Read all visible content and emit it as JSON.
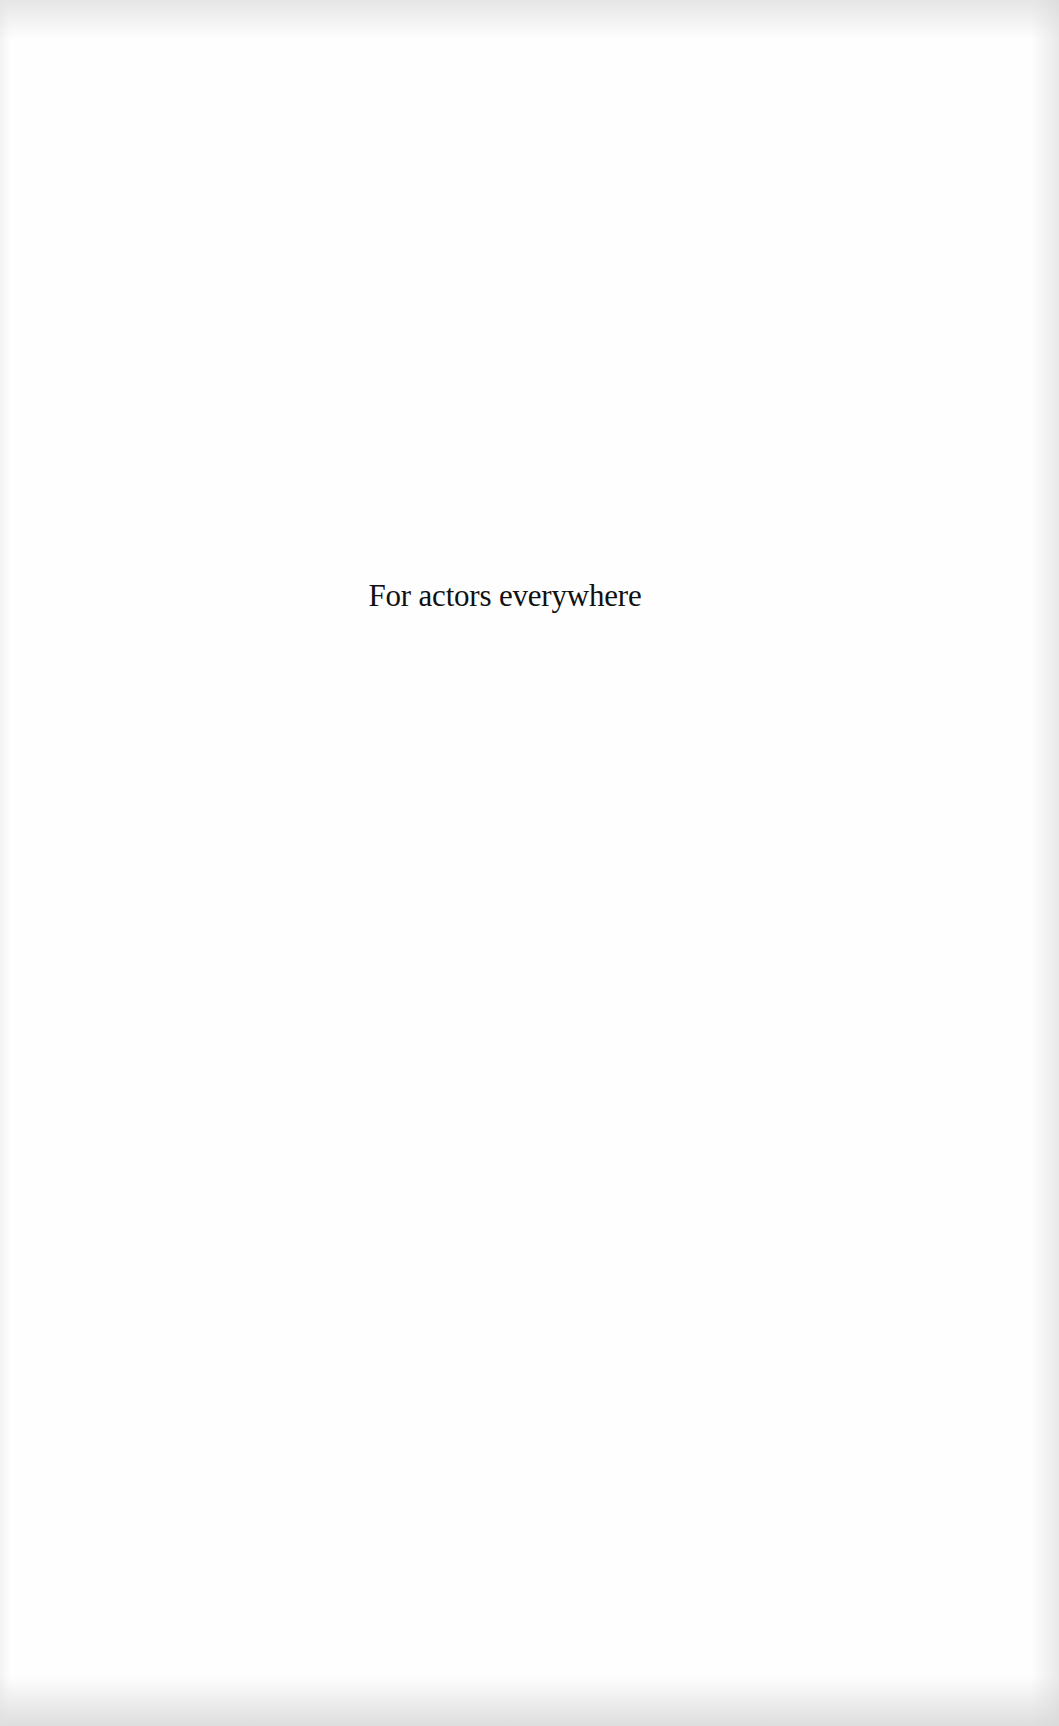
{
  "page": {
    "type": "dedication",
    "text": "For actors everywhere"
  },
  "colors": {
    "paper": "#fefefe",
    "ink": "#111111"
  }
}
